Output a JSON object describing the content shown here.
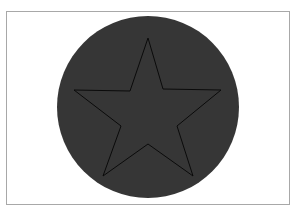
{
  "figure": {
    "shapes": [
      {
        "name": "circle",
        "fill": "#363636"
      },
      {
        "name": "star",
        "points": 5,
        "stroke": "#0a0a0a",
        "fill": "none"
      }
    ],
    "colors": {
      "background": "#ffffff",
      "frame_border": "#a8a8a8",
      "circle_fill": "#363636",
      "star_stroke": "#0a0a0a"
    }
  }
}
